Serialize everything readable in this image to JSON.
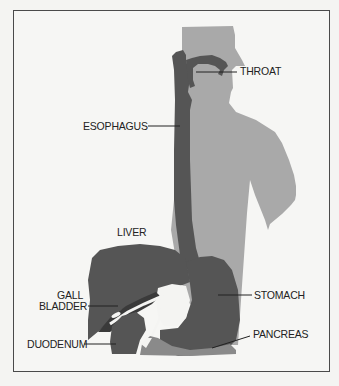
{
  "diagram": {
    "colors": {
      "background": "#f6f6f4",
      "border": "#4a4a4a",
      "body_silhouette": "#a9a9a9",
      "organ_dark": "#555555",
      "organ_mid": "#8a8a8a",
      "duct_white": "#f4f4f2",
      "leader_line": "#222222"
    },
    "labels": {
      "throat": "THROAT",
      "esophagus": "ESOPHAGUS",
      "liver": "LIVER",
      "gall": "GALL",
      "bladder": "BLADDER",
      "stomach": "STOMACH",
      "pancreas": "PANCREAS",
      "duodenum": "DUODENUM"
    }
  }
}
